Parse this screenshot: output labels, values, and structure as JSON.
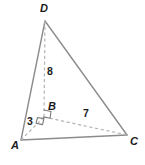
{
  "figure": {
    "kind": "geometry-diagram",
    "shape": "tetrahedron",
    "vertices": [
      {
        "id": "D",
        "label": "D",
        "x": 45,
        "y": 21
      },
      {
        "id": "B",
        "label": "B",
        "x": 44,
        "y": 117
      },
      {
        "id": "A",
        "label": "A",
        "x": 21,
        "y": 140
      },
      {
        "id": "C",
        "label": "C",
        "x": 127,
        "y": 135
      }
    ],
    "edges": [
      {
        "id": "AD",
        "from": "A",
        "to": "D",
        "style": "solid"
      },
      {
        "id": "DC",
        "from": "D",
        "to": "C",
        "style": "solid"
      },
      {
        "id": "AC",
        "from": "A",
        "to": "C",
        "style": "solid"
      },
      {
        "id": "DB",
        "from": "D",
        "to": "B",
        "style": "dashed",
        "measure": "8"
      },
      {
        "id": "AB",
        "from": "A",
        "to": "B",
        "style": "dashed",
        "measure": "3"
      },
      {
        "id": "BC",
        "from": "B",
        "to": "C",
        "style": "dashed",
        "measure": "7"
      }
    ],
    "measures": {
      "db": "8",
      "ab": "3",
      "bc": "7"
    },
    "right_angle_marks": [
      {
        "id": "angle-DBC",
        "at": "B"
      },
      {
        "id": "angle-ABC",
        "at": "B"
      }
    ],
    "colors": {
      "solid_edge": "#8c8c8c",
      "dashed_edge": "#b5b5b5",
      "mark": "#7a7a7a",
      "label": "#1a1a1a",
      "background": "#ffffff"
    }
  }
}
